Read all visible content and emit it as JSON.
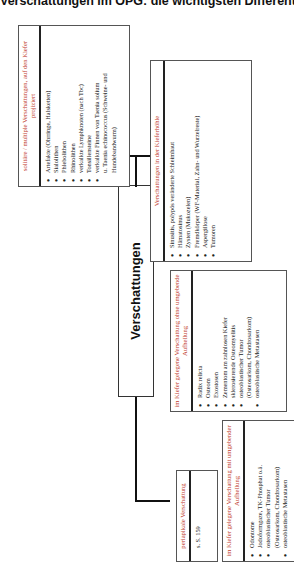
{
  "page_title": "Verschattungen im OPG: die wichtigsten Differentialdiagnosen",
  "center_label": "Verschattungen",
  "boxes": {
    "periapikal": {
      "title": "periapikale Verschattung",
      "items": [
        "s. S. 159"
      ]
    },
    "mit_aufhellung": {
      "title": "im Kiefer gelegene Verschattung mit umgebender Aufhellung",
      "items": [
        "Odontome",
        "Jodoformgaze, TK-Phosphat o.ä.",
        "osteoblastischer Tumor",
        "(Osteosarkom, Chondrosarkom)",
        "osteoblastische Metastasen"
      ]
    },
    "ohne_aufhellung": {
      "title": "im Kiefer gelegene Verschattung ohne umgebende Aufhellung",
      "items": [
        "Radix relicta",
        "Osteom",
        "Exostosen",
        "Zementom am zahnlosen Kiefer",
        "sklerosierende Osteomyelitis",
        "osteoblastischer Tumor",
        "(Osteosarkom, Chondrosarkom)",
        "osteoblastische Metastasen"
      ]
    },
    "kieferhoehle": {
      "title": "Verschattungen in der Kieferhöhle",
      "items": [
        "Sinusitis, polypös veränderte Schleimhaut",
        "Hämatosinus",
        "Zysten (Mukozelen)",
        "Fremdkörper (WF-Material, Zahn- und Wurzelreste)",
        "Aspergillose",
        "Tumoren"
      ]
    },
    "solitaer": {
      "title": "solitäre / multiple Verschattungen, auf den Kiefer projiziert",
      "items": [
        "Artefakte (Ohrringe, Halsketten)",
        "Sialolithen",
        "Phlebolithen",
        "Rhinolithen",
        "verkalkte Lymphknoten (nach Tbc)",
        "Tonsillensteine",
        "verkalkte Finnen von Taenia solium",
        "u. Taenia echinococcus (Schweine- und Hundebandwurm)"
      ]
    }
  }
}
